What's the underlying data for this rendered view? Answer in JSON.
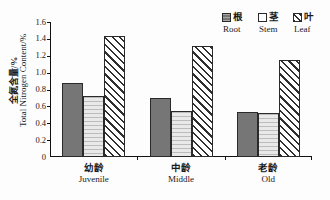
{
  "chart_data": {
    "type": "bar",
    "title": "",
    "xlabel": "",
    "ylabel": "全氮含量/%",
    "ylabel_en": "Total Nitrogen Content/%",
    "ylim": [
      0,
      1.6
    ],
    "yticks": [
      "0",
      "0.2",
      "0.4",
      "0.6",
      "0.8",
      "1.0",
      "1.2",
      "1.4",
      "1.6"
    ],
    "ytick_values": [
      0,
      0.2,
      0.4,
      0.6,
      0.8,
      1.0,
      1.2,
      1.4,
      1.6
    ],
    "grid": false,
    "legend_position": "top-right",
    "categories": [
      "幼龄",
      "中龄",
      "老龄"
    ],
    "categories_en": [
      "Juvenile",
      "Middle",
      "Old"
    ],
    "series": [
      {
        "name": "根",
        "name_en": "Root",
        "fill": "solid-dark-gray",
        "color": "#767676",
        "values": [
          0.88,
          0.7,
          0.53
        ]
      },
      {
        "name": "茎",
        "name_en": "Stem",
        "fill": "light-gray",
        "color": "#e9e9e9",
        "values": [
          0.72,
          0.54,
          0.52
        ]
      },
      {
        "name": "叶",
        "name_en": "Leaf",
        "fill": "diagonal-hatch",
        "color": "#ffffff",
        "values": [
          1.43,
          1.31,
          1.145
        ]
      }
    ]
  },
  "axis": {
    "y_title_cn": "全氮含量/%",
    "y_title_en": "Total Nitrogen Content/%"
  },
  "legend": {
    "items": [
      {
        "cn": "根",
        "en": "Root"
      },
      {
        "cn": "茎",
        "en": "Stem"
      },
      {
        "cn": "叶",
        "en": "Leaf"
      }
    ]
  },
  "xaxis": {
    "groups": [
      {
        "cn": "幼龄",
        "en": "Juvenile"
      },
      {
        "cn": "中龄",
        "en": "Middle"
      },
      {
        "cn": "老龄",
        "en": "Old"
      }
    ]
  }
}
